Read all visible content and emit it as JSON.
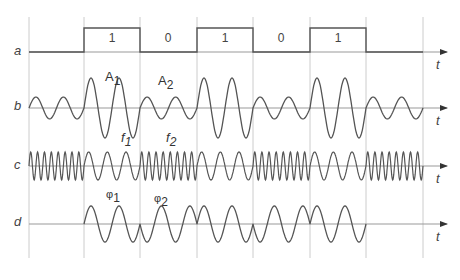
{
  "figure": {
    "type": "digital modulation timing diagram",
    "grid_x": [
      29,
      84,
      140,
      197,
      253,
      310,
      366,
      423
    ],
    "rows": [
      {
        "id": "a",
        "label": "a",
        "axis_label": "t",
        "axis_y": 52,
        "description": "binary data signal"
      },
      {
        "id": "b",
        "label": "b",
        "axis_label": "t",
        "axis_y": 108,
        "description": "amplitude modulation (ASK)"
      },
      {
        "id": "c",
        "label": "c",
        "axis_label": "t",
        "axis_y": 166,
        "description": "frequency modulation (FSK)"
      },
      {
        "id": "d",
        "label": "d",
        "axis_label": "t",
        "axis_y": 224,
        "description": "phase modulation (PSK)"
      }
    ],
    "bits": [
      "1",
      "0",
      "1",
      "0",
      "1"
    ],
    "annotations": {
      "A1": {
        "base": "A",
        "sub": "1"
      },
      "A2": {
        "base": "A",
        "sub": "2"
      },
      "f1": {
        "base": "f",
        "sub": "1"
      },
      "f2": {
        "base": "f",
        "sub": "2"
      },
      "phi1": {
        "base": "φ",
        "sub": "1"
      },
      "phi2": {
        "base": "φ",
        "sub": "2"
      }
    },
    "colors": {
      "wave": "#555555",
      "axis": "#999999",
      "grid": "#cccccc",
      "text": "#444444"
    }
  }
}
